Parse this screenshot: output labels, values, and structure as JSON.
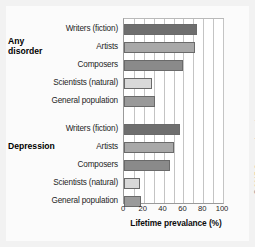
{
  "figure": {
    "xlabel": "Lifetime prevalance (%)",
    "copyright": "© 2017 Cengage Learning",
    "group_titles": {
      "any_disorder": "Any\ndisorder",
      "any_disorder_line1": "Any",
      "any_disorder_line2": "disorder",
      "depression": "Depression"
    }
  },
  "chart_data": {
    "type": "bar",
    "orientation": "horizontal",
    "title": "",
    "xlabel": "Lifetime prevalance (%)",
    "ylabel": "",
    "xlim": [
      0,
      100
    ],
    "xticks": [
      0,
      20,
      40,
      60,
      80,
      100
    ],
    "xtick_labels": [
      "0",
      "20",
      "40",
      "60",
      "80",
      "100"
    ],
    "grid": "vertical gridlines every 10 units",
    "legend": "none",
    "groups": [
      {
        "name": "Any disorder",
        "categories": [
          "Writers (fiction)",
          "Artists",
          "Composers",
          "Scientists (natural)",
          "General population"
        ],
        "values": [
          74,
          72,
          60,
          28,
          31
        ],
        "colors": [
          "#6e6e6e",
          "#a8a8a8",
          "#8a8a8a",
          "#d9d9d9",
          "#9a9a9a"
        ]
      },
      {
        "name": "Depression",
        "categories": [
          "Writers (fiction)",
          "Artists",
          "Composers",
          "Scientists (natural)",
          "General population"
        ],
        "values": [
          57,
          50,
          46,
          16,
          17
        ],
        "colors": [
          "#6e6e6e",
          "#a8a8a8",
          "#8a8a8a",
          "#d9d9d9",
          "#9a9a9a"
        ]
      }
    ]
  }
}
